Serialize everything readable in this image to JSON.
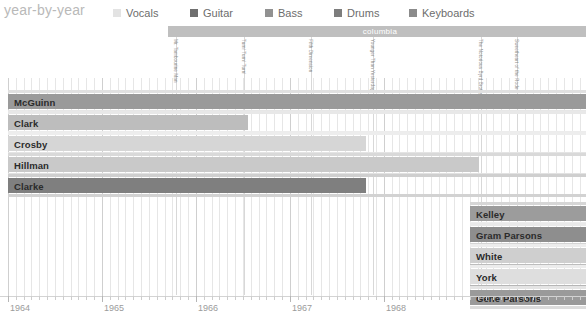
{
  "header": {
    "title": "year-by-year"
  },
  "legend": {
    "items": [
      {
        "label": "Vocals",
        "color": "#e3e3e3",
        "x": 0
      },
      {
        "label": "Guitar",
        "color": "#6f6f6f",
        "x": 77
      },
      {
        "label": "Bass",
        "color": "#919191",
        "x": 152
      },
      {
        "label": "Drums",
        "color": "#7d7d7d",
        "x": 221
      },
      {
        "label": "Keyboards",
        "color": "#8b8b8b",
        "x": 296
      }
    ]
  },
  "label_band": {
    "text": "columbia",
    "color": "#bfbfbf"
  },
  "albums": [
    {
      "title": "Mr. Tambourine Man",
      "x": 176
    },
    {
      "title": "Turn! Turn! Turn!",
      "x": 244
    },
    {
      "title": "Fifth Dimension",
      "x": 311
    },
    {
      "title": "Younger Than Yesterday",
      "x": 373
    },
    {
      "title": "The Notorious Byrd Brothers",
      "x": 481
    },
    {
      "title": "Sweetheart of the Rodeo",
      "x": 517
    }
  ],
  "axis": {
    "years": [
      "1964",
      "1965",
      "1966",
      "1967",
      "1968"
    ],
    "year_x": [
      8,
      102,
      196,
      290,
      384
    ],
    "minor_step": 7.83,
    "range_start_x": 8,
    "range_end_x": 586
  },
  "chart_data": {
    "type": "bar",
    "title": "year-by-year",
    "xlabel": "",
    "ylabel": "",
    "categories": [
      "McGuinn",
      "Clark",
      "Crosby",
      "Hillman",
      "Clarke",
      "Kelley",
      "Gram Parsons",
      "White",
      "York",
      "Gene Parsons"
    ],
    "series": [
      {
        "name": "McGuinn",
        "start_x": 8,
        "end_x": 586,
        "row_y": 0,
        "height": 15,
        "color": "#9a9a9a",
        "strips": [
          {
            "x": 8,
            "w": 578,
            "y": -4,
            "color": "#e0e0e0"
          },
          {
            "x": 8,
            "w": 578,
            "y": 16,
            "color": "#e6e6e6"
          }
        ]
      },
      {
        "name": "Clark",
        "start_x": 8,
        "end_x": 248,
        "row_y": 21,
        "height": 15,
        "color": "#bdbdbd",
        "strips": [
          {
            "x": 8,
            "w": 578,
            "y": -4,
            "color": "#e8e8e8"
          },
          {
            "x": 8,
            "w": 578,
            "y": 16,
            "color": "#ececec"
          }
        ]
      },
      {
        "name": "Crosby",
        "start_x": 8,
        "end_x": 366,
        "row_y": 42,
        "height": 15,
        "color": "#d6d6d6",
        "strips": [
          {
            "x": 8,
            "w": 578,
            "y": -4,
            "color": "#ededed"
          },
          {
            "x": 8,
            "w": 578,
            "y": 16,
            "color": "#e4e4e4"
          }
        ]
      },
      {
        "name": "Hillman",
        "start_x": 8,
        "end_x": 479,
        "row_y": 63,
        "height": 15,
        "color": "#c9c9c9",
        "strips": [
          {
            "x": 8,
            "w": 578,
            "y": -4,
            "color": "#d9d9d9"
          },
          {
            "x": 8,
            "w": 578,
            "y": 16,
            "color": "#e2e2e2"
          }
        ]
      },
      {
        "name": "Clarke",
        "start_x": 8,
        "end_x": 366,
        "row_y": 84,
        "height": 15,
        "color": "#7f7f7f",
        "strips": [
          {
            "x": 8,
            "w": 578,
            "y": -4,
            "color": "#cfcfcf"
          },
          {
            "x": 8,
            "w": 578,
            "y": 16,
            "color": "#d2d2d2"
          }
        ]
      },
      {
        "name": "Kelley",
        "start_x": 470,
        "end_x": 586,
        "row_y": 112,
        "height": 15,
        "color": "#9c9c9c",
        "strips": [
          {
            "x": 470,
            "w": 116,
            "y": -4,
            "color": "#d6d6d6"
          },
          {
            "x": 470,
            "w": 116,
            "y": 16,
            "color": "#ededed"
          }
        ]
      },
      {
        "name": "Gram Parsons",
        "start_x": 470,
        "end_x": 586,
        "row_y": 133,
        "height": 15,
        "color": "#8e8e8e",
        "strips": [
          {
            "x": 470,
            "w": 116,
            "y": -4,
            "color": "#e9e9e9"
          },
          {
            "x": 470,
            "w": 116,
            "y": 16,
            "color": "#d4d4d4"
          }
        ]
      },
      {
        "name": "White",
        "start_x": 470,
        "end_x": 586,
        "row_y": 154,
        "height": 15,
        "color": "#cfcfcf",
        "strips": [
          {
            "x": 470,
            "w": 116,
            "y": -4,
            "color": "#ececec"
          },
          {
            "x": 470,
            "w": 116,
            "y": 16,
            "color": "#bdbdbd"
          }
        ]
      },
      {
        "name": "York",
        "start_x": 470,
        "end_x": 586,
        "row_y": 175,
        "height": 15,
        "color": "#dedede",
        "strips": [
          {
            "x": 470,
            "w": 116,
            "y": -4,
            "color": "#ececec"
          },
          {
            "x": 470,
            "w": 116,
            "y": 16,
            "color": "#b6b6b6"
          }
        ]
      },
      {
        "name": "Gene Parsons",
        "start_x": 470,
        "end_x": 586,
        "row_y": 196,
        "height": 15,
        "color": "#9a9a9a",
        "strips": [
          {
            "x": 470,
            "w": 116,
            "y": -4,
            "color": "#e4e4e4"
          },
          {
            "x": 470,
            "w": 116,
            "y": 16,
            "color": "#dcdcdc"
          }
        ]
      }
    ]
  }
}
